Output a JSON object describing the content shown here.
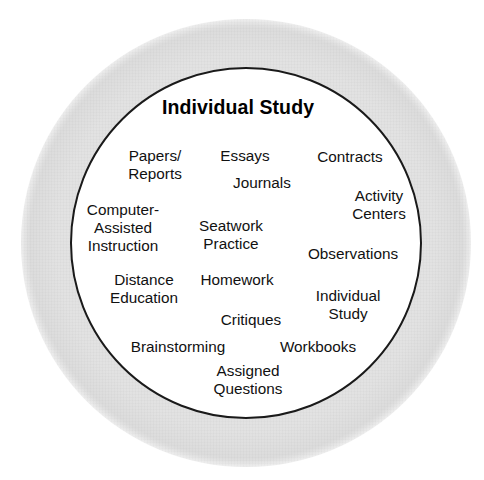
{
  "diagram": {
    "title": "Individual Study",
    "shapes": {
      "outer_ring_label": "outer shaded ring",
      "inner_circle_label": "inner white circle"
    },
    "colors": {
      "ring_gray": "#e2e2e2",
      "circle_outline": "#1a1a1a",
      "circle_fill": "#ffffff",
      "text": "#111111"
    },
    "labels": [
      {
        "text": "Papers/\nReports",
        "x": 155,
        "y": 165
      },
      {
        "text": "Essays",
        "x": 245,
        "y": 156
      },
      {
        "text": "Contracts",
        "x": 350,
        "y": 157
      },
      {
        "text": "Journals",
        "x": 262,
        "y": 183
      },
      {
        "text": "Activity\nCenters",
        "x": 379,
        "y": 205
      },
      {
        "text": "Computer-\nAssisted\nInstruction",
        "x": 123,
        "y": 228
      },
      {
        "text": "Seatwork\nPractice",
        "x": 231,
        "y": 235
      },
      {
        "text": "Observations",
        "x": 353,
        "y": 254
      },
      {
        "text": "Distance\nEducation",
        "x": 144,
        "y": 289
      },
      {
        "text": "Homework",
        "x": 237,
        "y": 280
      },
      {
        "text": "Individual\nStudy",
        "x": 348,
        "y": 305
      },
      {
        "text": "Critiques",
        "x": 251,
        "y": 320
      },
      {
        "text": "Brainstorming",
        "x": 178,
        "y": 347
      },
      {
        "text": "Workbooks",
        "x": 318,
        "y": 347
      },
      {
        "text": "Assigned\nQuestions",
        "x": 248,
        "y": 380
      }
    ]
  }
}
